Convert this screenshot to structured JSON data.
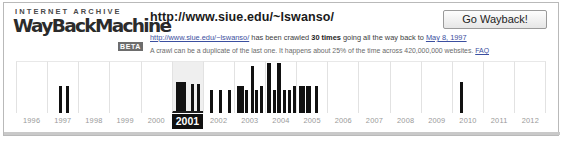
{
  "brand": {
    "kicker": "INTERNET ARCHIVE",
    "wordmark": "WayBackMachine",
    "badge": "BETA"
  },
  "header": {
    "url": "http://www.siue.edu/~lswanso/",
    "go_button_label": "Go Wayback!",
    "info_line_1": {
      "link_text": "http://www.siue.edu/~lswanso/",
      "text_before_count": " has been crawled ",
      "count": "30 times",
      "text_after_count": " going all the way back to ",
      "first_crawl_date": "May 8, 1997"
    },
    "info_line_2": {
      "text": "A crawl can be a duplicate of the last one. It happens about 25% of the time across 420,000,000 websites. ",
      "faq_label": "FAQ"
    }
  },
  "timeline": {
    "selected_year": "2001",
    "years": [
      "1996",
      "1997",
      "1998",
      "1999",
      "2000",
      "2001",
      "2002",
      "2003",
      "2004",
      "2005",
      "2006",
      "2007",
      "2008",
      "2009",
      "2010",
      "2011",
      "2012"
    ]
  },
  "chart_data": {
    "type": "bar",
    "xlabel": "Year",
    "ylabel": "Crawls",
    "categories": [
      "1996",
      "1997",
      "1998",
      "1999",
      "2000",
      "2001",
      "2002",
      "2003",
      "2004",
      "2005",
      "2006",
      "2007",
      "2008",
      "2009",
      "2010",
      "2011",
      "2012"
    ],
    "values": [
      0,
      2,
      0,
      0,
      0,
      5,
      3,
      7,
      7,
      3,
      0,
      0,
      0,
      0,
      1,
      0,
      0
    ],
    "total_crawls": "30 times",
    "first_crawl": "May 8, 1997",
    "grid": false,
    "legend": false,
    "bars": [
      {
        "year_index": 1,
        "offset_pct": 36,
        "height_pct": 52,
        "width_px": 3
      },
      {
        "year_index": 1,
        "offset_pct": 58,
        "height_pct": 52,
        "width_px": 3
      },
      {
        "year_index": 5,
        "offset_pct": 10,
        "height_pct": 56,
        "width_px": 7
      },
      {
        "year_index": 5,
        "offset_pct": 35,
        "height_pct": 56,
        "width_px": 3
      },
      {
        "year_index": 5,
        "offset_pct": 60,
        "height_pct": 52,
        "width_px": 3
      },
      {
        "year_index": 5,
        "offset_pct": 80,
        "height_pct": 52,
        "width_px": 3
      },
      {
        "year_index": 6,
        "offset_pct": 22,
        "height_pct": 45,
        "width_px": 3
      },
      {
        "year_index": 6,
        "offset_pct": 52,
        "height_pct": 45,
        "width_px": 3
      },
      {
        "year_index": 6,
        "offset_pct": 82,
        "height_pct": 45,
        "width_px": 3
      },
      {
        "year_index": 7,
        "offset_pct": 8,
        "height_pct": 52,
        "width_px": 7
      },
      {
        "year_index": 7,
        "offset_pct": 35,
        "height_pct": 45,
        "width_px": 3
      },
      {
        "year_index": 7,
        "offset_pct": 52,
        "height_pct": 90,
        "width_px": 3
      },
      {
        "year_index": 7,
        "offset_pct": 68,
        "height_pct": 45,
        "width_px": 3
      },
      {
        "year_index": 7,
        "offset_pct": 84,
        "height_pct": 52,
        "width_px": 3
      },
      {
        "year_index": 8,
        "offset_pct": 4,
        "height_pct": 96,
        "width_px": 4
      },
      {
        "year_index": 8,
        "offset_pct": 22,
        "height_pct": 45,
        "width_px": 3
      },
      {
        "year_index": 8,
        "offset_pct": 38,
        "height_pct": 96,
        "width_px": 4
      },
      {
        "year_index": 8,
        "offset_pct": 56,
        "height_pct": 45,
        "width_px": 3
      },
      {
        "year_index": 8,
        "offset_pct": 72,
        "height_pct": 45,
        "width_px": 3
      },
      {
        "year_index": 8,
        "offset_pct": 88,
        "height_pct": 52,
        "width_px": 3
      },
      {
        "year_index": 9,
        "offset_pct": 6,
        "height_pct": 52,
        "width_px": 6
      },
      {
        "year_index": 9,
        "offset_pct": 30,
        "height_pct": 52,
        "width_px": 5
      },
      {
        "year_index": 9,
        "offset_pct": 58,
        "height_pct": 52,
        "width_px": 3
      },
      {
        "year_index": 14,
        "offset_pct": 24,
        "height_pct": 60,
        "width_px": 3
      }
    ]
  }
}
